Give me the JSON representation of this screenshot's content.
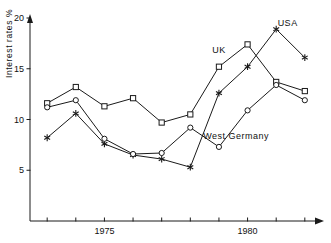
{
  "chart_data": {
    "type": "line",
    "title": "",
    "xlabel": "",
    "ylabel": "Interest rates %",
    "xlim": [
      1972.4,
      1982.6
    ],
    "ylim": [
      0,
      20
    ],
    "yticks": [
      5,
      10,
      15,
      20
    ],
    "ytick_labels": [
      "5",
      "10",
      "15",
      "20"
    ],
    "xticks": [
      1973,
      1974,
      1975,
      1976,
      1977,
      1978,
      1979,
      1980,
      1981,
      1982
    ],
    "xtick_labels": [
      "",
      "",
      "1975",
      "",
      "",
      "",
      "",
      "1980",
      "",
      ""
    ],
    "grid": false,
    "legend": "inline-annotations",
    "x": [
      1973,
      1974,
      1975,
      1976,
      1977,
      1978,
      1979,
      1980,
      1981,
      1982
    ],
    "series": [
      {
        "name": "UK",
        "marker": "square",
        "values": [
          11.6,
          13.2,
          11.3,
          12.1,
          9.7,
          10.5,
          15.2,
          17.4,
          13.7,
          12.8
        ]
      },
      {
        "name": "USA",
        "marker": "star",
        "values": [
          8.2,
          10.6,
          7.6,
          6.5,
          6.1,
          5.3,
          12.6,
          15.2,
          18.9,
          16.1
        ]
      },
      {
        "name": "West Germany",
        "marker": "circle",
        "values": [
          11.2,
          11.9,
          8.1,
          6.6,
          6.7,
          9.2,
          7.3,
          10.9,
          13.4,
          11.9
        ]
      }
    ],
    "annotations": [
      {
        "text": "UK",
        "x": 1979.0,
        "y": 16.6
      },
      {
        "text": "USA",
        "x": 1981.4,
        "y": 19.2
      },
      {
        "text": "West Germany",
        "x": 1979.6,
        "y": 8.1
      }
    ],
    "colors": {
      "line": "#1a1a1a",
      "axis": "#1a1a1a",
      "background": "#ffffff",
      "text": "#111111"
    }
  }
}
